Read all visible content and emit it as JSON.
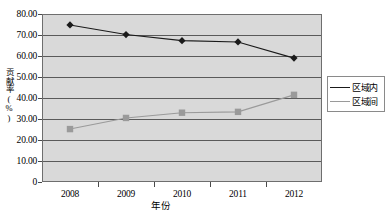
{
  "chart_data": {
    "type": "line",
    "title": "",
    "xlabel": "年份",
    "ylabel": "贡献率(%)",
    "categories": [
      "2008",
      "2009",
      "2010",
      "2011",
      "2012"
    ],
    "series": [
      {
        "name": "区域内",
        "marker": "diamond",
        "color": "#1a1a1a",
        "values": [
          74.8,
          70.2,
          67.3,
          66.7,
          59.0
        ]
      },
      {
        "name": "区域间",
        "marker": "square",
        "color": "#9a9a9a",
        "values": [
          25.2,
          30.5,
          33.0,
          33.4,
          41.5
        ]
      }
    ],
    "ylim": [
      0,
      80
    ],
    "yticks": [
      "80.00",
      "70.00",
      "60.00",
      "50.00",
      "40.00",
      "30.00",
      "20.00",
      "10.00",
      "0"
    ],
    "ytick_values": [
      80,
      70,
      60,
      50,
      40,
      30,
      20,
      10,
      0
    ],
    "grid": true,
    "legend_position": "right",
    "plot_background": "#d9d9d9",
    "gridline_color": "#5a5a5a"
  },
  "legend": {
    "entries": [
      {
        "label": "区域内"
      },
      {
        "label": "区域间"
      }
    ]
  }
}
